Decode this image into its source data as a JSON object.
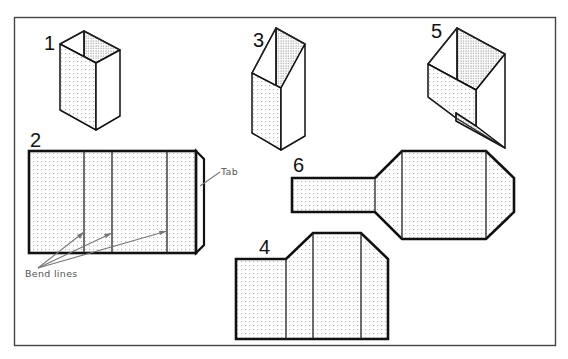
{
  "diagram": {
    "figures": [
      {
        "id": "1",
        "label": "1",
        "description": "Square prism (open top box)"
      },
      {
        "id": "2",
        "label": "2",
        "description": "Flat development of square prism with tab"
      },
      {
        "id": "3",
        "label": "3",
        "description": "Truncated prism with slanted top"
      },
      {
        "id": "4",
        "label": "4",
        "description": "Flat development of truncated prism"
      },
      {
        "id": "5",
        "label": "5",
        "description": "Prism with slanted bottom"
      },
      {
        "id": "6",
        "label": "6",
        "description": "Flat development of transition piece"
      }
    ],
    "annotations": {
      "tab": "Tab",
      "bend_lines": "Bend lines"
    },
    "colors": {
      "line": "#111111",
      "leader": "#777777",
      "background": "#ffffff"
    }
  }
}
